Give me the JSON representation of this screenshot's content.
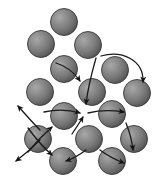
{
  "figure": {
    "type": "diagram",
    "background_color": "#ffffff",
    "width": 159,
    "height": 183,
    "caption_stub": ""
  },
  "style": {
    "sphere_radius": 13.5,
    "sphere_edge_color": "#3a3a3a",
    "sphere_fill_dark": "#4a4a4a",
    "sphere_fill_mid": "#7e7e7e",
    "sphere_fill_light": "#a8a8a8",
    "highlight_offset_x": -0.32,
    "highlight_offset_y": -0.34,
    "arrow_color": "#1a1a1a",
    "arrow_width": 1.3
  },
  "spheres": [
    {
      "id": "s1",
      "label": "sphere-top-center",
      "cx": 64,
      "cy": 22,
      "r": 13.5
    },
    {
      "id": "s2",
      "label": "sphere-row2-left",
      "cx": 41,
      "cy": 44,
      "r": 13.5
    },
    {
      "id": "s3",
      "label": "sphere-row2-right",
      "cx": 88,
      "cy": 45,
      "r": 13.5
    },
    {
      "id": "s4",
      "label": "sphere-row3-left",
      "cx": 64,
      "cy": 69,
      "r": 13.5
    },
    {
      "id": "s5",
      "label": "sphere-row3-right",
      "cx": 115,
      "cy": 70,
      "r": 13.5
    },
    {
      "id": "s6",
      "label": "sphere-row4-far-left",
      "cx": 40,
      "cy": 92,
      "r": 13.5
    },
    {
      "id": "s7",
      "label": "sphere-row4-center",
      "cx": 92,
      "cy": 92,
      "r": 13.5
    },
    {
      "id": "s8",
      "label": "sphere-row4-right",
      "cx": 137,
      "cy": 93,
      "r": 13.5
    },
    {
      "id": "s9",
      "label": "sphere-row5-left",
      "cx": 64,
      "cy": 116,
      "r": 13.5
    },
    {
      "id": "s10",
      "label": "sphere-row5-center",
      "cx": 112,
      "cy": 114,
      "r": 13.5
    },
    {
      "id": "s11",
      "label": "sphere-row6-far-left",
      "cx": 38,
      "cy": 139,
      "r": 13.5
    },
    {
      "id": "s12",
      "label": "sphere-row6-center",
      "cx": 89,
      "cy": 139,
      "r": 13.5
    },
    {
      "id": "s13",
      "label": "sphere-row6-right",
      "cx": 134,
      "cy": 139,
      "r": 13.5
    },
    {
      "id": "s14",
      "label": "sphere-row7-left",
      "cx": 63,
      "cy": 161,
      "r": 13.5
    },
    {
      "id": "s15",
      "label": "sphere-row7-right",
      "cx": 112,
      "cy": 161,
      "r": 13.5
    }
  ],
  "arrows": [
    {
      "id": "a1",
      "label": "arrow-into-vacancy-from-upper-left",
      "path": "M 56 63 C 66 66, 74 72, 80 81",
      "arrowhead_at": {
        "x": 82,
        "y": 84
      },
      "arrowhead_angle": 56
    },
    {
      "id": "a2",
      "label": "arrow-sweep-right-upper",
      "path": "M 101 56 C 122 50, 144 60, 143 82",
      "arrowhead_at": {
        "x": 142,
        "y": 86
      },
      "arrowhead_angle": 100
    },
    {
      "id": "a3",
      "label": "arrow-down-through-center-spheres",
      "path": "M 96 58 C 92 72, 88 86, 86 104",
      "arrowhead_at": {
        "x": 86,
        "y": 108
      },
      "arrowhead_angle": 95
    },
    {
      "id": "a4",
      "label": "arrow-into-vacancy-from-left",
      "path": "M 44 112 C 58 109, 70 110, 80 113",
      "arrowhead_at": {
        "x": 84,
        "y": 114
      },
      "arrowhead_angle": 12
    },
    {
      "id": "a5",
      "label": "arrow-into-vacancy-from-below-left",
      "path": "M 72 134 C 76 128, 80 122, 83 117",
      "arrowhead_at": {
        "x": 85,
        "y": 114
      },
      "arrowhead_angle": -58
    },
    {
      "id": "a6",
      "label": "arrow-from-vacancy-to-right",
      "path": "M 88 113 C 100 110, 112 110, 124 112",
      "arrowhead_at": {
        "x": 128,
        "y": 113
      },
      "arrowhead_angle": 8
    },
    {
      "id": "a7",
      "label": "arrow-out-upper-left",
      "path": "M 40 130 C 32 122, 25 114, 18 106",
      "arrowhead_at": {
        "x": 15,
        "y": 103
      },
      "arrowhead_angle": -136
    },
    {
      "id": "a8",
      "label": "arrow-out-lower-left",
      "path": "M 40 140 C 32 148, 24 155, 16 161",
      "arrowhead_at": {
        "x": 12,
        "y": 164
      },
      "arrowhead_angle": 143
    },
    {
      "id": "a9",
      "label": "arrow-bottom-left-into-sphere",
      "path": "M 86 150 C 78 156, 72 159, 66 161",
      "arrowhead_at": {
        "x": 62,
        "y": 162
      },
      "arrowhead_angle": 172
    },
    {
      "id": "a10",
      "label": "arrow-bottom-right-descending",
      "path": "M 100 150 C 108 156, 116 160, 124 163",
      "arrowhead_at": {
        "x": 128,
        "y": 164
      },
      "arrowhead_angle": 20
    },
    {
      "id": "a11",
      "label": "arrow-right-down-to-lower-right",
      "path": "M 126 123 C 130 133, 132 141, 133 150",
      "arrowhead_at": {
        "x": 133,
        "y": 154
      },
      "arrowhead_angle": 85
    },
    {
      "id": "a12",
      "label": "arrow-left-cross-descending",
      "path": "M 28 128 C 36 139, 44 148, 52 155",
      "arrowhead_at": {
        "x": 55,
        "y": 158
      },
      "arrowhead_angle": 42
    },
    {
      "id": "a13",
      "label": "arrow-left-cross-ascending",
      "path": "M 28 152 C 36 142, 44 134, 52 127",
      "arrowhead_at": {
        "x": 55,
        "y": 124
      },
      "arrowhead_angle": -42
    }
  ]
}
